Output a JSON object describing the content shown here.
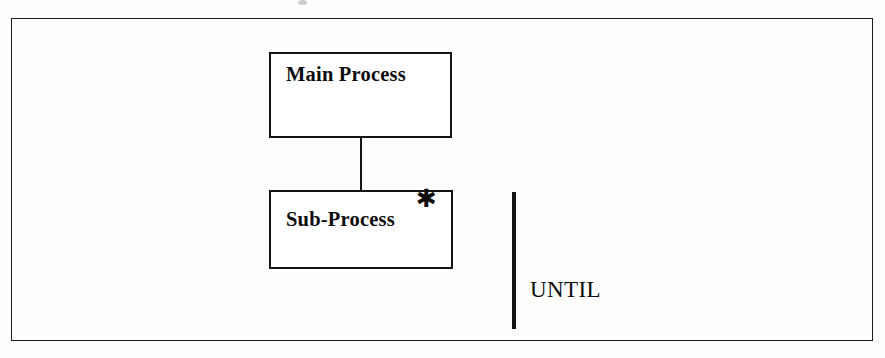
{
  "diagram": {
    "type": "process-decomposition-flow",
    "background_color": "#fdfdfc",
    "line_color": "#141414",
    "frame": {
      "name": "outer-border",
      "border_color": "#1b1b1b"
    },
    "nodes": [
      {
        "id": "main-process",
        "label": "Main Process",
        "marker": ""
      },
      {
        "id": "sub-process",
        "label": "Sub-Process",
        "marker": "✱"
      }
    ],
    "connector": {
      "from": "main-process",
      "to": "sub-process",
      "style": "vertical-line"
    },
    "annotation": {
      "label": "UNTIL",
      "bar": "vertical-thick-bar"
    }
  }
}
